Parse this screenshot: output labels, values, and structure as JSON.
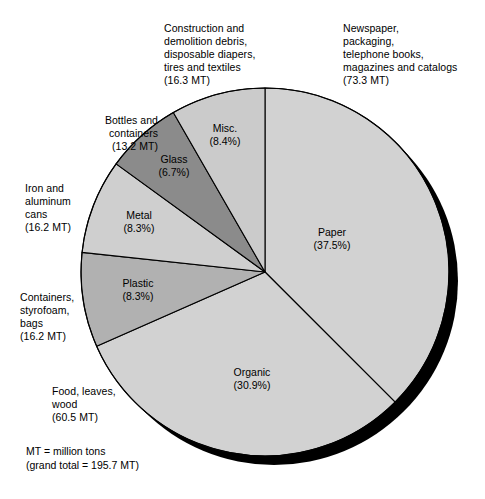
{
  "chart_data": {
    "type": "pie",
    "title": "",
    "subtitle": "",
    "unit_note": "MT = million tons",
    "grand_total_note": "(grand total = 195.7 MT)",
    "grand_total_mt": 195.7,
    "legend_position": "callouts around pie",
    "categories": [
      "Paper",
      "Organic",
      "Plastic",
      "Metal",
      "Glass",
      "Misc."
    ],
    "values": [
      37.5,
      30.9,
      8.3,
      8.3,
      6.7,
      8.4
    ],
    "tons_mt": [
      73.3,
      60.5,
      16.2,
      16.2,
      13.2,
      16.3
    ],
    "slices": [
      {
        "name": "Paper",
        "percent": 37.5,
        "percent_label": "(37.5%)",
        "tons_label": "(73.3 MT)",
        "description": "Newspaper,\npackaging,\ntelephone books,\nmagazines and catalogs",
        "color": "#d2d2d2",
        "start_deg": 0,
        "end_deg": 135
      },
      {
        "name": "Organic",
        "percent": 30.9,
        "percent_label": "(30.9%)",
        "tons_label": "(60.5 MT)",
        "description": "Food, leaves,\nwood",
        "color": "#d2d2d2",
        "start_deg": 135,
        "end_deg": 246.24
      },
      {
        "name": "Plastic",
        "percent": 8.3,
        "percent_label": "(8.3%)",
        "tons_label": "(16.2 MT)",
        "description": "Containers,\nstyrofoam,\nbags",
        "color": "#b1b1b1",
        "start_deg": 246.24,
        "end_deg": 276.12
      },
      {
        "name": "Metal",
        "percent": 8.3,
        "percent_label": "(8.3%)",
        "tons_label": "(16.2 MT)",
        "description": "Iron and\naluminum\ncans",
        "color": "#cfcfcf",
        "start_deg": 276.12,
        "end_deg": 306.0
      },
      {
        "name": "Glass",
        "percent": 6.7,
        "percent_label": "(6.7%)",
        "tons_label": "(13.2 MT)",
        "description": "Bottles and\ncontainers",
        "color": "#8b8b8b",
        "start_deg": 306.0,
        "end_deg": 330.12
      },
      {
        "name": "Misc.",
        "percent": 8.4,
        "percent_label": "(8.4%)",
        "tons_label": "(16.3 MT)",
        "description": "Construction and\ndemolition debris,\ndisposable diapers,\ntires and textiles",
        "color": "#cbcbcb",
        "start_deg": 330.12,
        "end_deg": 360
      }
    ],
    "colors": {
      "shadow": "#000000",
      "outline": "#000000",
      "light_gray": "#d2d2d2",
      "mid_gray": "#b1b1b1",
      "dark_gray": "#8b8b8b",
      "background": "#ffffff"
    }
  },
  "callouts": {
    "misc": {
      "text": "Construction and\ndemolition debris,\ndisposable diapers,\ntires and textiles\n(16.3 MT)"
    },
    "paper": {
      "text": "Newspaper,\npackaging,\ntelephone books,\nmagazines and catalogs\n(73.3 MT)"
    },
    "glass": {
      "text": "Bottles and\ncontainers\n(13.2 MT)"
    },
    "metal": {
      "text": "Iron and\naluminum\ncans\n(16.2 MT)"
    },
    "plastic": {
      "text": "Containers,\nstyrofoam,\nbags\n(16.2 MT)"
    },
    "organic": {
      "text": "Food, leaves,\nwood\n(60.5 MT)"
    }
  },
  "slice_labels": {
    "misc": "Misc.\n(8.4%)",
    "glass": "Glass\n(6.7%)",
    "metal": "Metal\n(8.3%)",
    "plastic": "Plastic\n(8.3%)",
    "paper": "Paper\n(37.5%)",
    "organic": "Organic\n(30.9%)"
  },
  "footnote": {
    "text": "MT = million tons\n(grand total = 195.7 MT)"
  }
}
